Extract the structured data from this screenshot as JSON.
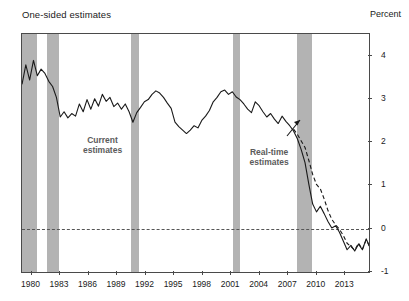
{
  "header": {
    "title": "One-sided estimates",
    "unit_label": "Percent"
  },
  "annotations": [
    {
      "name": "current-estimates",
      "line1": "Current",
      "line2": "estimates",
      "x_pct": 23.5,
      "y_pct": 47
    },
    {
      "name": "real-time-estimates",
      "line1": "Real-time",
      "line2": "estimates",
      "x_pct": 71.5,
      "y_pct": 52
    }
  ],
  "chart_data": {
    "type": "line",
    "title": "One-sided estimates",
    "xlabel": "",
    "ylabel": "Percent",
    "xlim": [
      1979.0,
      2015.5
    ],
    "ylim": [
      -1,
      4.5
    ],
    "yticks": [
      4,
      3,
      2,
      1,
      0,
      -1
    ],
    "xticks": [
      1980,
      1983,
      1986,
      1989,
      1992,
      1995,
      1998,
      2001,
      2004,
      2007,
      2010,
      2013
    ],
    "grid": false,
    "legend_position": "inline-annotations",
    "zero_reference_line": {
      "value": 0,
      "style": "dashed",
      "color": "#555555"
    },
    "shaded_regions": {
      "label": "recessions",
      "color": "#b3b3b3",
      "spans": [
        [
          1979.0,
          1980.6
        ],
        [
          1981.6,
          1982.9
        ],
        [
          1990.5,
          1991.3
        ],
        [
          2001.2,
          2001.9
        ],
        [
          2007.9,
          2009.5
        ]
      ]
    },
    "series": [
      {
        "name": "Current estimates",
        "style": "solid",
        "color": "#1a1a1a",
        "x": [
          1979.0,
          1979.4,
          1979.8,
          1980.2,
          1980.6,
          1981.0,
          1981.4,
          1981.8,
          1982.2,
          1982.6,
          1983.0,
          1983.4,
          1983.8,
          1984.2,
          1984.6,
          1985.0,
          1985.4,
          1985.8,
          1986.2,
          1986.6,
          1987.0,
          1987.4,
          1987.8,
          1988.2,
          1988.6,
          1989.0,
          1989.4,
          1989.8,
          1990.2,
          1990.6,
          1991.0,
          1991.4,
          1991.8,
          1992.2,
          1992.6,
          1993.0,
          1993.4,
          1993.8,
          1994.2,
          1994.6,
          1995.0,
          1995.4,
          1995.8,
          1996.2,
          1996.6,
          1997.0,
          1997.4,
          1997.8,
          1998.2,
          1998.6,
          1999.0,
          1999.4,
          1999.8,
          2000.2,
          2000.6,
          2001.0,
          2001.4,
          2001.8,
          2002.2,
          2002.6,
          2003.0,
          2003.4,
          2003.8,
          2004.2,
          2004.6,
          2005.0,
          2005.4,
          2005.8,
          2006.2,
          2006.6,
          2007.0,
          2007.4,
          2007.8,
          2008.2,
          2008.6,
          2009.0,
          2009.4,
          2009.8,
          2010.2,
          2010.6,
          2011.0,
          2011.4,
          2011.8,
          2012.2,
          2012.6,
          2013.0,
          2013.4,
          2013.8,
          2014.2,
          2014.6,
          2015.0,
          2015.4
        ],
        "y": [
          3.35,
          3.8,
          3.45,
          3.9,
          3.55,
          3.7,
          3.6,
          3.42,
          3.3,
          3.05,
          2.6,
          2.72,
          2.58,
          2.68,
          2.62,
          2.9,
          2.72,
          3.0,
          2.78,
          3.02,
          2.85,
          3.12,
          2.96,
          3.05,
          2.84,
          2.92,
          2.78,
          2.9,
          2.72,
          2.48,
          2.7,
          2.82,
          2.95,
          3.0,
          3.12,
          3.2,
          3.15,
          3.05,
          2.92,
          2.8,
          2.48,
          2.38,
          2.3,
          2.22,
          2.3,
          2.4,
          2.35,
          2.52,
          2.62,
          2.75,
          2.95,
          3.05,
          3.18,
          3.22,
          3.12,
          3.18,
          3.06,
          3.0,
          2.9,
          2.78,
          2.7,
          2.95,
          2.86,
          2.72,
          2.6,
          2.68,
          2.55,
          2.45,
          2.62,
          2.5,
          2.4,
          2.28,
          2.1,
          1.85,
          1.55,
          1.05,
          0.6,
          0.42,
          0.55,
          0.38,
          0.2,
          0.05,
          0.1,
          -0.05,
          -0.25,
          -0.45,
          -0.35,
          -0.48,
          -0.32,
          -0.45,
          -0.2,
          -0.4
        ]
      },
      {
        "name": "Real-time estimates",
        "style": "dashed",
        "color": "#1a1a1a",
        "x": [
          2007.4,
          2007.8,
          2008.2,
          2008.6,
          2009.0,
          2009.4,
          2009.8,
          2010.2,
          2010.6,
          2011.0,
          2011.4,
          2011.8,
          2012.2,
          2012.6,
          2013.0,
          2013.4,
          2013.8,
          2014.2,
          2014.6,
          2015.0,
          2015.4
        ],
        "y": [
          2.32,
          2.2,
          2.05,
          1.9,
          1.6,
          1.28,
          1.05,
          0.95,
          0.72,
          0.45,
          0.25,
          0.12,
          0.02,
          -0.12,
          -0.3,
          -0.38,
          -0.46,
          -0.3,
          -0.44,
          -0.22,
          -0.4
        ]
      }
    ]
  }
}
